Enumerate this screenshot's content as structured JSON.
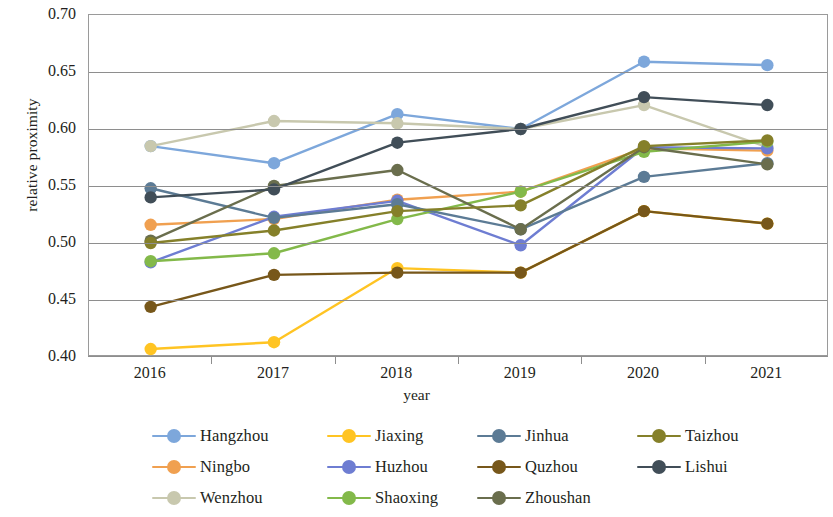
{
  "chart_data": {
    "type": "line",
    "title": "",
    "xlabel": "year",
    "ylabel": "relative proximity",
    "categories": [
      "2016",
      "2017",
      "2018",
      "2019",
      "2020",
      "2021"
    ],
    "ylim": [
      0.4,
      0.7
    ],
    "y_ticks": [
      "0.40",
      "0.45",
      "0.50",
      "0.55",
      "0.60",
      "0.65",
      "0.70"
    ],
    "y_tick_values": [
      0.4,
      0.45,
      0.5,
      0.55,
      0.6,
      0.65,
      0.7
    ],
    "grid": "horizontal",
    "legend_position": "bottom",
    "series": [
      {
        "name": "Hangzhou",
        "color": "#7DA7DB",
        "values": [
          0.585,
          0.57,
          0.613,
          0.6,
          0.659,
          0.656
        ]
      },
      {
        "name": "Ningbo",
        "color": "#F0A050",
        "values": [
          0.516,
          0.521,
          0.538,
          0.545,
          0.583,
          0.581
        ]
      },
      {
        "name": "Wenzhou",
        "color": "#C8C8AE",
        "values": [
          0.585,
          0.607,
          0.605,
          0.6,
          0.621,
          0.584
        ]
      },
      {
        "name": "Jiaxing",
        "color": "#FFC423",
        "values": [
          0.407,
          0.413,
          0.478,
          0.474,
          0.528,
          0.517
        ]
      },
      {
        "name": "Huzhou",
        "color": "#6E7DD2",
        "values": [
          0.483,
          0.523,
          0.537,
          0.498,
          0.584,
          0.583
        ]
      },
      {
        "name": "Shaoxing",
        "color": "#83B94A",
        "values": [
          0.484,
          0.491,
          0.521,
          0.545,
          0.58,
          0.589
        ]
      },
      {
        "name": "Jinhua",
        "color": "#5C7B95",
        "values": [
          0.548,
          0.522,
          0.534,
          0.512,
          0.558,
          0.57
        ]
      },
      {
        "name": "Quzhou",
        "color": "#77571A",
        "values": [
          0.444,
          0.472,
          0.474,
          0.474,
          0.528,
          0.517
        ]
      },
      {
        "name": "Zhoushan",
        "color": "#6A6E4D",
        "values": [
          0.502,
          0.55,
          0.564,
          0.512,
          0.584,
          0.569
        ]
      },
      {
        "name": "Taizhou",
        "color": "#85802A",
        "values": [
          0.5,
          0.511,
          0.528,
          0.533,
          0.585,
          0.59
        ]
      },
      {
        "name": "Lishui",
        "color": "#414E58",
        "values": [
          0.54,
          0.547,
          0.588,
          0.6,
          0.628,
          0.621
        ]
      }
    ]
  },
  "axes": {
    "y_title": "relative proximity",
    "x_title": "year"
  }
}
